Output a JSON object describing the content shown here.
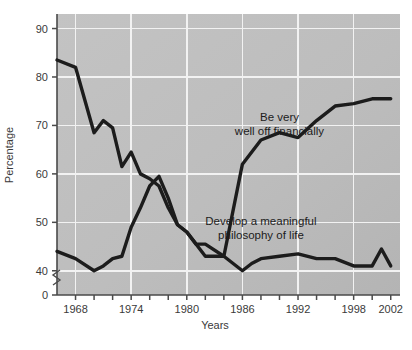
{
  "chart_data": {
    "type": "line",
    "title": "",
    "xlabel": "Years",
    "ylabel": "Percentage",
    "xlim": [
      1966,
      2003
    ],
    "ylim": [
      35,
      93
    ],
    "grid": true,
    "legend_position": "inline-annotation",
    "y_ticks": [
      40,
      50,
      60,
      70,
      80,
      90
    ],
    "y_axis_break": true,
    "y_zero_label": "0",
    "x_ticks": [
      1968,
      1970,
      1972,
      1974,
      1976,
      1978,
      1980,
      1982,
      1984,
      1986,
      1988,
      1990,
      1992,
      1994,
      1996,
      1998,
      2000,
      2002
    ],
    "x_tick_labels": [
      1968,
      1974,
      1980,
      1986,
      1992,
      1998,
      2002
    ],
    "x_gridlines": [
      1968,
      1974,
      1980,
      1986,
      1992,
      1998
    ],
    "y_gridlines": [
      40,
      50,
      60,
      70,
      80,
      90
    ],
    "series": [
      {
        "name": "Develop a meaningful philosophy of life",
        "annotation_lines": [
          "Develop a meaningful",
          "philosophy of life"
        ],
        "color": "#1c1c1c",
        "x": [
          1966,
          1968,
          1970,
          1971,
          1972,
          1973,
          1974,
          1975,
          1976,
          1977,
          1978,
          1979,
          1980,
          1981,
          1982,
          1984,
          1986,
          1987,
          1988,
          1990,
          1992,
          1994,
          1996,
          1998,
          2000,
          2001,
          2002
        ],
        "values": [
          83.5,
          82.0,
          68.5,
          71.0,
          69.5,
          61.5,
          64.5,
          60.0,
          59.0,
          57.5,
          53.0,
          49.5,
          48.0,
          45.5,
          45.5,
          43.0,
          40.0,
          41.5,
          42.5,
          43.0,
          43.5,
          42.5,
          42.5,
          41.0,
          41.0,
          44.5,
          41.0
        ]
      },
      {
        "name": "Be very well off financially",
        "annotation_lines": [
          "Be very",
          "well off financially"
        ],
        "color": "#1c1c1c",
        "x": [
          1966,
          1968,
          1970,
          1971,
          1972,
          1973,
          1974,
          1975,
          1976,
          1977,
          1978,
          1979,
          1980,
          1982,
          1984,
          1986,
          1988,
          1990,
          1992,
          1994,
          1996,
          1998,
          2000,
          2002
        ],
        "values": [
          44.0,
          42.5,
          40.0,
          41.0,
          42.5,
          43.0,
          49.0,
          53.0,
          57.5,
          59.5,
          55.0,
          49.5,
          48.0,
          43.0,
          43.0,
          62.0,
          67.0,
          68.5,
          67.5,
          71.0,
          74.0,
          74.5,
          75.5,
          75.5
        ]
      }
    ],
    "annotations": [
      {
        "text": "Be very",
        "x": 1990,
        "y": 71.0
      },
      {
        "text": "well off financially",
        "x": 1990,
        "y": 68.0
      },
      {
        "text": "Develop a meaningful",
        "x": 1988,
        "y": 49.5
      },
      {
        "text": "philosophy of life",
        "x": 1988,
        "y": 46.5
      }
    ],
    "plot_background": "#bcbcbc",
    "grid_color": "#f2f2f2",
    "axis_color": "#4a4a4a"
  }
}
